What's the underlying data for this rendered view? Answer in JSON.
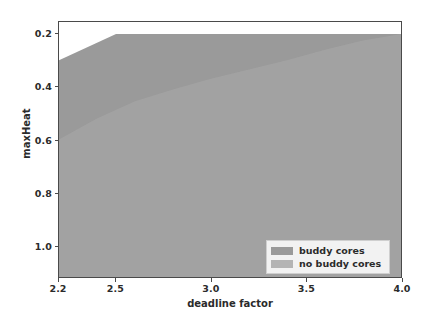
{
  "chart_data": {
    "type": "area",
    "title": "",
    "xlabel": "deadline factor",
    "ylabel": "maxHeat",
    "xlim": [
      2.2,
      4.0
    ],
    "ylim": [
      1.12,
      0.155
    ],
    "y_inverted": true,
    "grid": false,
    "legend_position": "lower right",
    "xticks": [
      "2.2",
      "2.5",
      "3.0",
      "3.5",
      "4.0"
    ],
    "xtick_values": [
      2.2,
      2.5,
      3.0,
      3.5,
      4.0
    ],
    "yticks": [
      "0.2",
      "0.4",
      "0.6",
      "0.8",
      "1.0"
    ],
    "ytick_values": [
      0.2,
      0.4,
      0.6,
      0.8,
      1.0
    ],
    "series": [
      {
        "name": "buddy cores",
        "color": "#9a9a9a",
        "fill_from": 1.12,
        "x": [
          2.2,
          2.5,
          3.0,
          3.5,
          4.0
        ],
        "values": [
          0.3,
          0.2,
          0.2,
          0.2,
          0.2
        ]
      },
      {
        "name": "no buddy cores",
        "color": "#a8a8a8",
        "fill_from": 1.12,
        "x": [
          2.2,
          2.4,
          2.6,
          2.8,
          3.0,
          3.2,
          3.4,
          3.6,
          3.8,
          4.0
        ],
        "values": [
          0.6,
          0.52,
          0.455,
          0.41,
          0.37,
          0.335,
          0.3,
          0.26,
          0.225,
          0.2
        ]
      }
    ]
  },
  "axes": {
    "x_title": "deadline factor",
    "y_title": "maxHeat",
    "xticks": [
      {
        "label": "2.2",
        "value": 2.2
      },
      {
        "label": "2.5",
        "value": 2.5
      },
      {
        "label": "3.0",
        "value": 3.0
      },
      {
        "label": "3.5",
        "value": 3.5
      },
      {
        "label": "4.0",
        "value": 4.0
      }
    ],
    "yticks": [
      {
        "label": "0.2",
        "value": 0.2
      },
      {
        "label": "0.4",
        "value": 0.4
      },
      {
        "label": "0.6",
        "value": 0.6
      },
      {
        "label": "0.8",
        "value": 0.8
      },
      {
        "label": "1.0",
        "value": 1.0
      }
    ]
  },
  "legend": {
    "entries": [
      {
        "label": "buddy cores",
        "color": "#9a9a9a"
      },
      {
        "label": "no buddy cores",
        "color": "#b4b4b4"
      }
    ]
  },
  "colors": {
    "background": "#ffffff",
    "frame": "#4a4a4a",
    "text": "#2b2b2b",
    "buddy_fill": "#9a9a9a",
    "no_buddy_fill": "#a8a8a8"
  }
}
